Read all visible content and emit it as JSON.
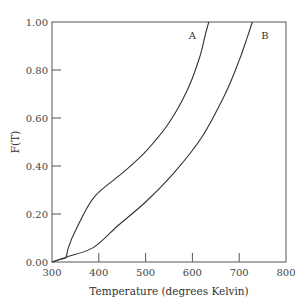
{
  "chart_data": {
    "type": "line",
    "title": "",
    "xlabel": "Temperature (degrees Kelvin)",
    "ylabel": "F(T)",
    "xlim": [
      300,
      800
    ],
    "ylim": [
      0,
      1.0
    ],
    "xticks": [
      300,
      400,
      500,
      600,
      700,
      800
    ],
    "xtick_labels": [
      "300",
      "400",
      "500",
      "600",
      "700",
      "800"
    ],
    "yticks": [
      0,
      0.2,
      0.4,
      0.6,
      0.8,
      1.0
    ],
    "ytick_labels": [
      "0.00",
      "0.20",
      "0.40",
      "0.60",
      "0.80",
      "1.00"
    ],
    "grid": false,
    "legend": "none",
    "series": [
      {
        "name": "A",
        "x": [
          300,
          320,
          330,
          335,
          350,
          390,
          450,
          500,
          550,
          590,
          615,
          628,
          635
        ],
        "y": [
          0,
          0.012,
          0.02,
          0.06,
          0.13,
          0.27,
          0.37,
          0.46,
          0.58,
          0.72,
          0.85,
          0.95,
          1.0
        ]
      },
      {
        "name": "B",
        "x": [
          300,
          330,
          388,
          440,
          500,
          560,
          620,
          670,
          700,
          718,
          728
        ],
        "y": [
          0,
          0.02,
          0.06,
          0.15,
          0.25,
          0.37,
          0.52,
          0.7,
          0.84,
          0.94,
          1.0
        ]
      }
    ]
  }
}
